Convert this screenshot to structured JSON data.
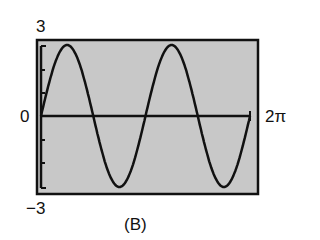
{
  "chart_data": {
    "type": "line",
    "title": "",
    "caption": "(B)",
    "function": "y = 3 sin(2x)",
    "xlabel": "",
    "ylabel": "",
    "xlim": [
      0,
      6.2832
    ],
    "ylim": [
      -3,
      3
    ],
    "x_tick_labels": {
      "left": "0",
      "right": "2π"
    },
    "y_tick_labels": {
      "top": "3",
      "bottom": "−3"
    },
    "grid": false,
    "background_color": "#c8c8c8",
    "line_color": "#111111",
    "series": [
      {
        "name": "y = 3 sin(2x)",
        "x": [
          0,
          0.3927,
          0.7854,
          1.1781,
          1.5708,
          1.9635,
          2.3562,
          2.7489,
          3.1416,
          3.5343,
          3.927,
          4.3197,
          4.7124,
          5.1051,
          5.4978,
          5.8905,
          6.2832
        ],
        "values": [
          0,
          2.12,
          3,
          2.12,
          0,
          -2.12,
          -3,
          -2.12,
          0,
          2.12,
          3,
          2.12,
          0,
          -2.12,
          -3,
          -2.12,
          0
        ]
      }
    ]
  },
  "labels": {
    "ymax": "3",
    "ymin": "−3",
    "origin": "0",
    "xmax": "2π",
    "caption": "(B)"
  }
}
